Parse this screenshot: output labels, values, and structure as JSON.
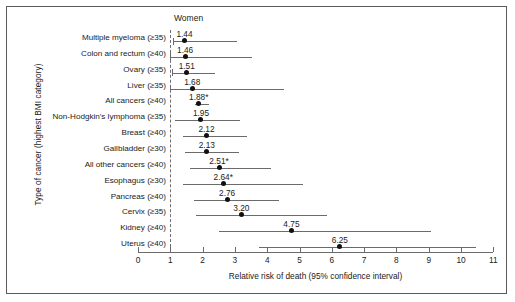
{
  "figure": {
    "series_header": "Women",
    "y_axis_title": "Type of cancer (highest BMI category)",
    "x_axis_title": "Relative risk of death (95% confidence interval)"
  },
  "chart_data": {
    "type": "scatter",
    "title": "",
    "subtitle": "",
    "xlabel": "Relative risk of death (95% confidence interval)",
    "ylabel": "Type of cancer (highest BMI category)",
    "xlim": [
      0,
      11
    ],
    "xticks": [
      0,
      1,
      2,
      3,
      4,
      5,
      6,
      7,
      8,
      9,
      10,
      11
    ],
    "xtick_labels": [
      "0",
      "1",
      "2",
      "3",
      "4",
      "5",
      "6",
      "7",
      "8",
      "9",
      "10",
      "11"
    ],
    "grid": false,
    "legend": "none",
    "reference_line": 1,
    "series_name": "Women",
    "categories": [
      "Multiple myeloma (≥35)",
      "Colon and rectum (≥40)",
      "Ovary (≥35)",
      "Liver (≥35)",
      "All cancers (≥40)",
      "Non-Hodgkin's lymphoma (≥35)",
      "Breast (≥40)",
      "Gallbladder (≥30)",
      "All other cancers (≥40)",
      "Esophagus (≥30)",
      "Pancreas (≥40)",
      "Cervix (≥35)",
      "Kidney (≥40)",
      "Uterus (≥40)"
    ],
    "points": [
      {
        "label": "Multiple myeloma (≥35)",
        "value": 1.44,
        "value_label": "1.44",
        "ci_low": 1.08,
        "ci_high": 3.08
      },
      {
        "label": "Colon and rectum (≥40)",
        "value": 1.46,
        "value_label": "1.46",
        "ci_low": 0.98,
        "ci_high": 3.54
      },
      {
        "label": "Ovary (≥35)",
        "value": 1.51,
        "value_label": "1.51",
        "ci_low": 1.05,
        "ci_high": 2.37
      },
      {
        "label": "Liver (≥35)",
        "value": 1.68,
        "value_label": "1.68",
        "ci_low": 0.98,
        "ci_high": 4.52
      },
      {
        "label": "All cancers (≥40)",
        "value": 1.88,
        "value_label": "1.88*",
        "ci_low": 1.77,
        "ci_high": 2.2
      },
      {
        "label": "Non-Hodgkin's lymphoma (≥35)",
        "value": 1.95,
        "value_label": "1.95",
        "ci_low": 1.14,
        "ci_high": 3.16
      },
      {
        "label": "Breast (≥40)",
        "value": 2.12,
        "value_label": "2.12",
        "ci_low": 1.38,
        "ci_high": 3.39
      },
      {
        "label": "Gallbladder (≥30)",
        "value": 2.13,
        "value_label": "2.13",
        "ci_low": 1.45,
        "ci_high": 3.13
      },
      {
        "label": "All other cancers (≥40)",
        "value": 2.51,
        "value_label": "2.51*",
        "ci_low": 1.6,
        "ci_high": 4.12
      },
      {
        "label": "Esophagus (≥30)",
        "value": 2.64,
        "value_label": "2.64*",
        "ci_low": 1.38,
        "ci_high": 5.12
      },
      {
        "label": "Pancreas (≥40)",
        "value": 2.76,
        "value_label": "2.76",
        "ci_low": 1.74,
        "ci_high": 4.36
      },
      {
        "label": "Cervix (≥35)",
        "value": 3.2,
        "value_label": "3.20",
        "ci_low": 1.81,
        "ci_high": 5.85
      },
      {
        "label": "Kidney (≥40)",
        "value": 4.75,
        "value_label": "4.75",
        "ci_low": 2.52,
        "ci_high": 9.07
      },
      {
        "label": "Uterus (≥40)",
        "value": 6.25,
        "value_label": "6.25",
        "ci_low": 3.75,
        "ci_high": 10.46
      }
    ]
  }
}
